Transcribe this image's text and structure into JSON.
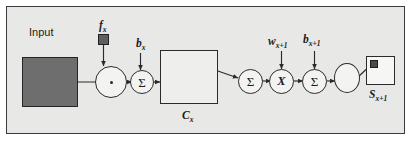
{
  "figure": {
    "background_color": "#e8e8e6",
    "border_color": "#3a3a3a",
    "page_color": "#ffffff"
  },
  "labels": {
    "input": "Input",
    "filter": "f",
    "filter_sub": "x",
    "bias_conv": "b",
    "bias_conv_sub": "x",
    "feature_map": "C",
    "feature_map_sub": "x",
    "weight_next": "w",
    "weight_next_sub": "x+1",
    "bias_next": "b",
    "bias_next_sub": "x+1",
    "output_map": "S",
    "output_map_sub": "x+1"
  },
  "nodes": [
    {
      "id": "conv-op",
      "name": "convolution-operator",
      "glyph": "•",
      "glyph_kind": "dot",
      "shape": "circle"
    },
    {
      "id": "sum-1",
      "name": "summation-conv-bias",
      "glyph": "Σ",
      "glyph_kind": "sigma",
      "shape": "circle"
    },
    {
      "id": "sum-2",
      "name": "summation-pool",
      "glyph": "Σ",
      "glyph_kind": "sigma",
      "shape": "circle"
    },
    {
      "id": "mul",
      "name": "multiply-weight",
      "glyph": "X",
      "glyph_kind": "times",
      "shape": "circle"
    },
    {
      "id": "sum-3",
      "name": "summation-next-bias",
      "glyph": "Σ",
      "glyph_kind": "sigma",
      "shape": "circle"
    },
    {
      "id": "sigmoid",
      "name": "sigmoid-activation",
      "glyph": "S-curve",
      "glyph_kind": "sigmoid",
      "shape": "circle"
    }
  ],
  "blocks": [
    {
      "id": "input-map",
      "name": "input-feature-map",
      "fill": "#6e6e6e",
      "label": "Input"
    },
    {
      "id": "filter-sq",
      "name": "filter-kernel-square",
      "fill": "#5f5f5f",
      "label": "f x"
    },
    {
      "id": "cmap",
      "name": "convolution-feature-map-grid",
      "fill": "#eeeeec",
      "label": "C x",
      "grid_cols": 10,
      "grid_rows": 9
    },
    {
      "id": "out-map",
      "name": "output-subsampled-map",
      "fill": "#f6f6f4",
      "label": "S x+1"
    }
  ],
  "flow": [
    "Input",
    "convolution-operator",
    "summation-conv-bias",
    "C x",
    "summation-pool",
    "multiply-weight",
    "summation-next-bias",
    "sigmoid-activation",
    "S x+1"
  ]
}
